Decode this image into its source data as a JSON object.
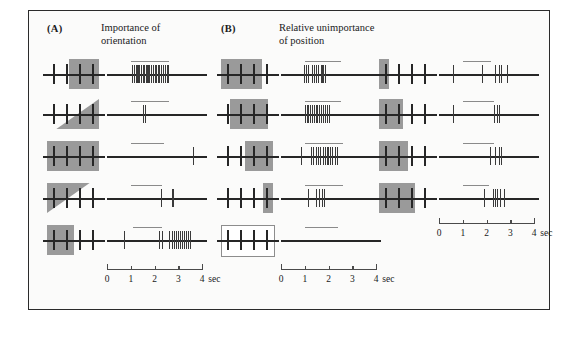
{
  "figure": {
    "panels": [
      {
        "tag": "(A)",
        "title_line1": "Importance of",
        "title_line2": "orientation"
      },
      {
        "tag": "(B)",
        "title_line1": "Relative unimportance",
        "title_line2": "of position"
      }
    ],
    "colors": {
      "stimulus_gray": "#9a9a9a",
      "trace_black": "#262626",
      "panel_border": "#2b2b2b",
      "background": "#fbfbfa"
    },
    "time_axis": {
      "labels": [
        "0",
        "1",
        "2",
        "3",
        "4"
      ],
      "unit": "sec",
      "range_sec": [
        0,
        4
      ],
      "tick_interval_sec": 1
    },
    "columns": [
      {
        "name": "orientation-column",
        "panel": "A",
        "trials": [
          {
            "id": "a1",
            "stimulus": {
              "shape": "rect",
              "orientation_deg": 90,
              "x_frac": 0.42,
              "width_frac": 0.58,
              "note": "vertical bar overlapping right field"
            },
            "stim_on_sec": 1.0,
            "stim_off_sec": 2.6,
            "spike_times_sec": [
              1.05,
              1.12,
              1.2,
              1.28,
              1.35,
              1.42,
              1.5,
              1.56,
              1.63,
              1.7,
              1.78,
              1.85,
              1.92,
              2.0,
              2.07,
              2.14,
              2.2,
              2.28,
              2.35,
              2.42,
              2.5,
              2.56
            ],
            "response": "strong sustained burst"
          },
          {
            "id": "a2",
            "stimulus": {
              "shape": "triangle-up",
              "orientation_deg": 45,
              "x_frac": 0.18,
              "width_frac": 0.82,
              "note": "bar tilted 45 degrees"
            },
            "stim_on_sec": 1.0,
            "stim_off_sec": 2.6,
            "spike_times_sec": [
              1.52,
              1.6
            ],
            "response": "two spikes only"
          },
          {
            "id": "a3",
            "stimulus": {
              "shape": "rect",
              "orientation_deg": 0,
              "x_frac": 0.0,
              "width_frac": 1.0,
              "note": "horizontal bar across field"
            },
            "stim_on_sec": 1.0,
            "stim_off_sec": 2.4,
            "spike_times_sec": [
              3.6
            ],
            "response": "single late spike"
          },
          {
            "id": "a4",
            "stimulus": {
              "shape": "triangle-down",
              "orientation_deg": 135,
              "x_frac": 0.0,
              "width_frac": 0.82,
              "note": "bar tilted 135 degrees"
            },
            "stim_on_sec": 1.0,
            "stim_off_sec": 2.3,
            "spike_times_sec": [
              2.25,
              2.75
            ],
            "response": "two sparse spikes"
          },
          {
            "id": "a5",
            "stimulus": {
              "shape": "rect",
              "orientation_deg": 90,
              "x_frac": 0.0,
              "width_frac": 0.52,
              "note": "vertical bar at left of field"
            },
            "stim_on_sec": 1.1,
            "stim_off_sec": 2.3,
            "spike_times_sec": [
              0.72,
              2.18,
              2.3,
              2.62,
              2.72,
              2.82,
              2.9,
              2.98,
              3.06,
              3.14,
              3.22,
              3.3,
              3.4,
              3.5
            ],
            "response": "late accelerating burst"
          }
        ]
      },
      {
        "name": "position-column-left",
        "panel": "B",
        "trials": [
          {
            "id": "b1",
            "stimulus": {
              "shape": "rect",
              "orientation_deg": 0,
              "x_frac": 0.0,
              "width_frac": 0.78,
              "note": "wide bar at far left"
            },
            "stim_on_sec": 1.0,
            "stim_off_sec": 2.5,
            "spike_times_sec": [
              0.95,
              1.05,
              1.12,
              1.3,
              1.38,
              1.46,
              1.55,
              1.7,
              1.78,
              1.86
            ],
            "response": "vigorous burst"
          },
          {
            "id": "b2",
            "stimulus": {
              "shape": "rect",
              "orientation_deg": 0,
              "x_frac": 0.18,
              "width_frac": 0.72,
              "note": "wide bar shifted right"
            },
            "stim_on_sec": 1.0,
            "stim_off_sec": 2.5,
            "spike_times_sec": [
              1.0,
              1.08,
              1.15,
              1.22,
              1.3,
              1.38,
              1.45,
              1.52,
              1.6,
              1.68,
              1.76,
              1.84,
              1.92,
              2.0
            ],
            "response": "vigorous burst"
          },
          {
            "id": "b3",
            "stimulus": {
              "shape": "rect",
              "orientation_deg": 0,
              "x_frac": 0.46,
              "width_frac": 0.54,
              "note": "bar over right half"
            },
            "stim_on_sec": 1.0,
            "stim_off_sec": 2.6,
            "spike_times_sec": [
              0.85,
              1.25,
              1.35,
              1.45,
              1.55,
              1.65,
              1.75,
              1.85,
              1.95,
              2.05,
              2.15,
              2.25,
              2.35
            ],
            "response": "vigorous burst"
          },
          {
            "id": "b4",
            "stimulus": {
              "shape": "rect",
              "orientation_deg": 90,
              "x_frac": 0.8,
              "width_frac": 0.2,
              "note": "narrow bar at right edge"
            },
            "stim_on_sec": 1.0,
            "stim_off_sec": 2.6,
            "spike_times_sec": [
              1.15,
              1.45,
              1.6,
              1.72,
              1.82
            ],
            "response": "moderate burst"
          },
          {
            "id": "b5",
            "stimulus": {
              "shape": "empty",
              "orientation_deg": 0,
              "x_frac": 0.0,
              "width_frac": 1.0,
              "note": "no stimulus, outline only"
            },
            "stim_on_sec": 1.0,
            "stim_off_sec": 2.4,
            "spike_times_sec": [],
            "response": "no response"
          }
        ]
      },
      {
        "name": "position-column-right",
        "panel": "B",
        "trials": [
          {
            "id": "b6",
            "stimulus": {
              "shape": "rect",
              "orientation_deg": 90,
              "x_frac": 0.0,
              "width_frac": 0.2,
              "note": "narrow bar at left edge"
            },
            "stim_on_sec": 1.0,
            "stim_off_sec": 2.2,
            "spike_times_sec": [
              0.6,
              1.8,
              2.35,
              2.5,
              2.6,
              2.85
            ],
            "response": "sparse spikes"
          },
          {
            "id": "b7",
            "stimulus": {
              "shape": "rect",
              "orientation_deg": 0,
              "x_frac": 0.0,
              "width_frac": 0.46,
              "note": "bar over left half"
            },
            "stim_on_sec": 1.0,
            "stim_off_sec": 2.3,
            "spike_times_sec": [
              0.6,
              2.3,
              2.42,
              2.5
            ],
            "response": "sparse spikes"
          },
          {
            "id": "b8",
            "stimulus": {
              "shape": "rect",
              "orientation_deg": 0,
              "x_frac": 0.0,
              "width_frac": 0.56,
              "note": "bar over left field"
            },
            "stim_on_sec": 1.0,
            "stim_off_sec": 2.3,
            "spike_times_sec": [
              2.15,
              2.35,
              2.5,
              2.62
            ],
            "response": "short burst"
          },
          {
            "id": "b9",
            "stimulus": {
              "shape": "rect",
              "orientation_deg": 0,
              "x_frac": 0.0,
              "width_frac": 0.7,
              "note": "wide bar over left field"
            },
            "stim_on_sec": 1.0,
            "stim_off_sec": 2.1,
            "spike_times_sec": [
              1.9,
              2.25,
              2.35,
              2.45,
              2.55,
              2.72
            ],
            "response": "short burst"
          }
        ]
      }
    ]
  }
}
